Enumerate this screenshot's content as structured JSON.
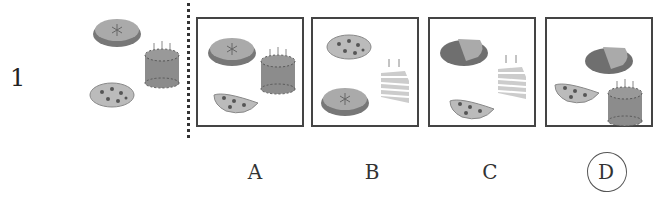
{
  "question": {
    "number": "1"
  },
  "reference_items": [
    "pie",
    "birthday-cake",
    "cookie"
  ],
  "options": [
    {
      "label": "A",
      "items": [
        "pie",
        "birthday-cake",
        "half-cookie"
      ]
    },
    {
      "label": "B",
      "items": [
        "cookie",
        "pie",
        "cake-slice"
      ]
    },
    {
      "label": "C",
      "items": [
        "pie-slice",
        "cake-slice",
        "half-cookie"
      ]
    },
    {
      "label": "D",
      "items": [
        "pie-slice",
        "half-cookie",
        "birthday-cake"
      ],
      "circled": true
    }
  ],
  "colors": {
    "pie_top": "#a9a9a9",
    "pie_dish": "#777777",
    "cake": "#8c8c8c",
    "cookie": "#bdbdbd",
    "dots": "#555555"
  }
}
